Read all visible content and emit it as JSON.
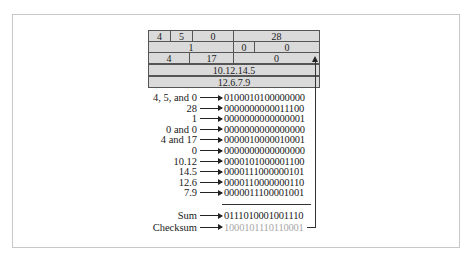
{
  "figure": {
    "header_table": {
      "rows": [
        {
          "cells": [
            "4",
            "5",
            "0",
            "28"
          ]
        },
        {
          "cells": [
            "1",
            "0",
            "0"
          ]
        },
        {
          "cells": [
            "4",
            "17",
            "0"
          ]
        },
        {
          "cells": [
            "10.12.14.5"
          ]
        },
        {
          "cells": [
            "12.6.7.9"
          ]
        }
      ]
    },
    "calculation": {
      "lines": [
        {
          "label": "4, 5,  and 0",
          "binary": "0100010100000000"
        },
        {
          "label": "28",
          "binary": "0000000000011100"
        },
        {
          "label": "1",
          "binary": "0000000000000001"
        },
        {
          "label": "0 and 0",
          "binary": "0000000000000000"
        },
        {
          "label": "4 and 17",
          "binary": "0000010000010001"
        },
        {
          "label": "0",
          "binary": "0000000000000000"
        },
        {
          "label": "10.12",
          "binary": "0000101000001100"
        },
        {
          "label": "14.5",
          "binary": "0000111000000101"
        },
        {
          "label": "12.6",
          "binary": "0000110000000110"
        },
        {
          "label": "7.9",
          "binary": "0000011100001001"
        }
      ],
      "sum": {
        "label": "Sum",
        "binary": "0111010001001110"
      },
      "checksum": {
        "label": "Checksum",
        "binary": "1000101110110001"
      }
    },
    "colors": {
      "cell_fill": "#dadada",
      "checksum_text": "#a8a8a8",
      "frame_border": "#c8c8c8"
    }
  }
}
